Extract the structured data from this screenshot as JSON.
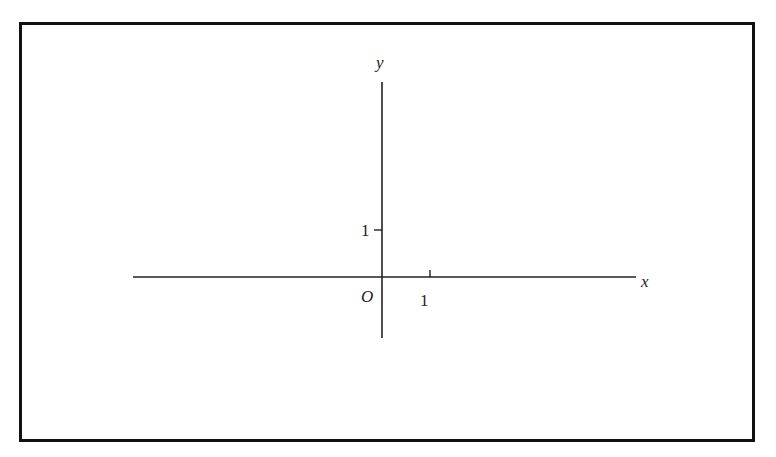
{
  "diagram": {
    "type": "coordinate-axes",
    "axes": {
      "x_label": "x",
      "y_label": "y",
      "origin_label": "O"
    },
    "ticks": {
      "x_tick_label": "1",
      "y_tick_label": "1"
    },
    "colors": {
      "stroke": "#111111",
      "background": "#ffffff"
    }
  }
}
